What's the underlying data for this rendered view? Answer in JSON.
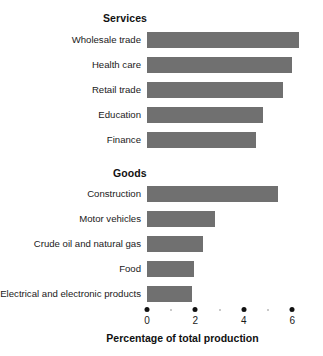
{
  "chart_data": {
    "type": "bar",
    "orientation": "horizontal",
    "title": "",
    "subtitle": "",
    "xlabel": "Percentage of total production",
    "ylabel": "",
    "xlim": [
      0,
      6.4
    ],
    "xticks": [
      0,
      2,
      4,
      6
    ],
    "xtick_labels": [
      "0",
      "2",
      "4",
      "6"
    ],
    "minor_xticks": [
      1,
      3,
      5
    ],
    "grid": false,
    "legend": "none",
    "bar_color": "#707070",
    "groups": [
      {
        "name": "Services",
        "categories": [
          "Wholesale trade",
          "Health care",
          "Retail trade",
          "Education",
          "Finance"
        ],
        "values": [
          6.3,
          6.0,
          5.6,
          4.8,
          4.5
        ]
      },
      {
        "name": "Goods",
        "categories": [
          "Construction",
          "Motor vehicles",
          "Crude oil and natural gas",
          "Food",
          "Electrical and electronic products"
        ],
        "values": [
          5.4,
          2.8,
          2.3,
          1.95,
          1.85
        ]
      }
    ]
  },
  "axis": {
    "title": "Percentage of total production",
    "ticks": [
      {
        "label": "0",
        "value": 0
      },
      {
        "label": "2",
        "value": 2
      },
      {
        "label": "4",
        "value": 4
      },
      {
        "label": "6",
        "value": 6
      }
    ],
    "minor_values": [
      1,
      3,
      5
    ]
  },
  "headings": {
    "services": "Services",
    "goods": "Goods"
  },
  "colors": {
    "bar": "#707070",
    "text": "#1a1a1a",
    "tick": "#111111",
    "minor_tick": "#b9b9b9",
    "background": "#ffffff"
  }
}
